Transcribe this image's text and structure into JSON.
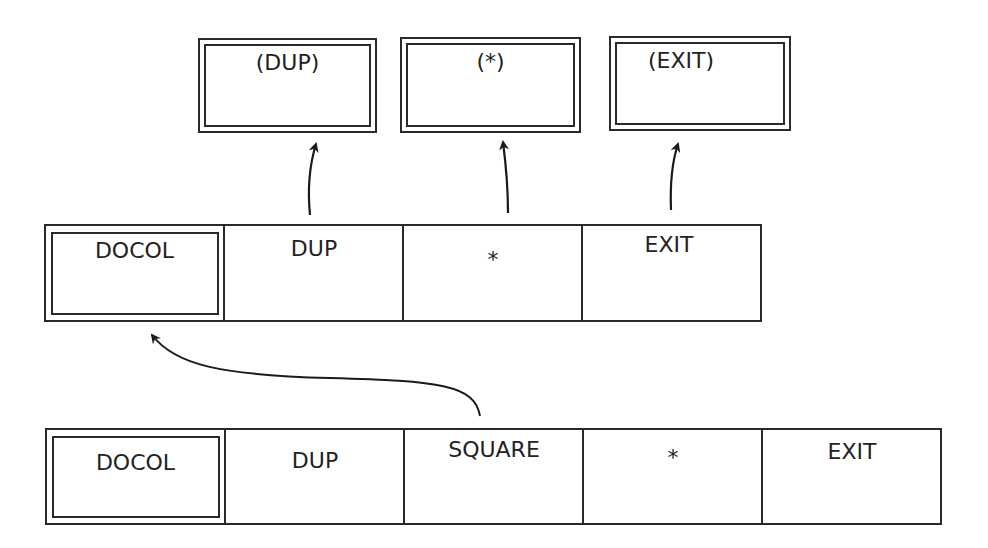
{
  "diagram": {
    "targets": [
      {
        "label": "(DUP)"
      },
      {
        "label": "(*)"
      },
      {
        "label": "(EXIT)"
      }
    ],
    "square_definition": {
      "cells": [
        {
          "label": "DOCOL"
        },
        {
          "label": "DUP"
        },
        {
          "label": "*"
        },
        {
          "label": "EXIT"
        }
      ]
    },
    "caller_definition": {
      "cells": [
        {
          "label": "DOCOL"
        },
        {
          "label": "DUP"
        },
        {
          "label": "SQUARE"
        },
        {
          "label": "*"
        },
        {
          "label": "EXIT"
        }
      ]
    },
    "arrows": [
      {
        "from": "square_definition.DUP",
        "to": "(DUP)"
      },
      {
        "from": "square_definition.*",
        "to": "(*)"
      },
      {
        "from": "square_definition.EXIT",
        "to": "(EXIT)"
      },
      {
        "from": "caller_definition.SQUARE",
        "to": "square_definition.DOCOL"
      }
    ],
    "colors": {
      "line": "#2a2a2a",
      "background": "#ffffff",
      "text": "#222222"
    }
  }
}
